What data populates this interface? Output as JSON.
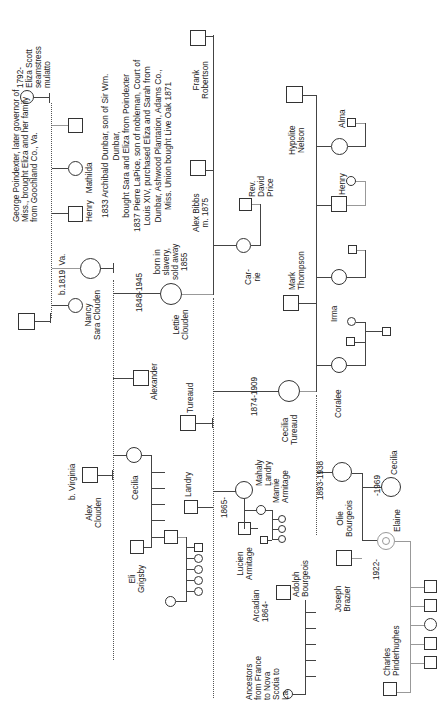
{
  "chart_title": "",
  "labels": {
    "eliza": "1792-\nEliza Scott\nseamstress\nmulatto",
    "poindexter": "George Poindexter, later governor of\nMiss., brought Eliza and her family\nfrom Goochland Co., Va.",
    "b1819": "b.1819  Va.",
    "nancy_sara": "Nancy\nSara Clouden",
    "henry_mathilda": "Henry   Mathilda",
    "dunbar": "1833 Archibald Dunbar, son of Sir Wm.\nDunbar,\nbought Sara and Eliza from Poindexter\n1837 Pierre LaPice, son of nobleman, Court of\nLouis XIV, purchased Eliza and Sarah from\nDunbar, Ashwood Plantation, Adams Co.,\nMiss. Union bought Live Oak 1871",
    "frank": "Frank\nRobertson",
    "alex_bibbs": "Alex Bibbs\nm. 1875",
    "lettie_dates": "1848-1945",
    "lettie_note": "born in\nslavery,\nsold away\n1855",
    "lettie": "Lettie\nClouden",
    "rev_david": "Rev.\nDavid\nPrice",
    "carrie": "Car-\nrie",
    "hypolite": "Hypolite\nNelson",
    "alma": "Alma",
    "henry2": "Henry",
    "mark": "Mark\nThompson",
    "irma": "Irma",
    "coralee": "Coralee",
    "alexander": "Alexander",
    "tureaud": "Tureaud",
    "cecilia_t_dates": "1874-1909",
    "cecilia_t": "Cecilia\nTureaud",
    "b_virginia": "b. Virginia",
    "alex_clouden": "Alex\nClouden",
    "cecilia": "Cecilia",
    "landry": "Landry",
    "eli": "Eli\nGrigsby",
    "mahaly": "Mahaly\nLandry",
    "y1865": "1865-",
    "mamie": "Mamie\nArmitage",
    "lucien": "Lucien\nArmitage",
    "adolph": "Adolph\nBourgeois",
    "arcadian": "Arcadian\n1864-",
    "ancestors": "Ancestors\nfrom France\nto Nova\nScotia to\nLa.",
    "olie_dates": "1893-1938",
    "olie": "Olie\nBourgeois",
    "cecilia2_dates": "-1969",
    "cecilia2": "Cecilia",
    "elaine": "Elaine",
    "y1922": "1922-",
    "joseph": "Joseph\nBrazier",
    "charles": "Charles\nPinderhughes"
  }
}
